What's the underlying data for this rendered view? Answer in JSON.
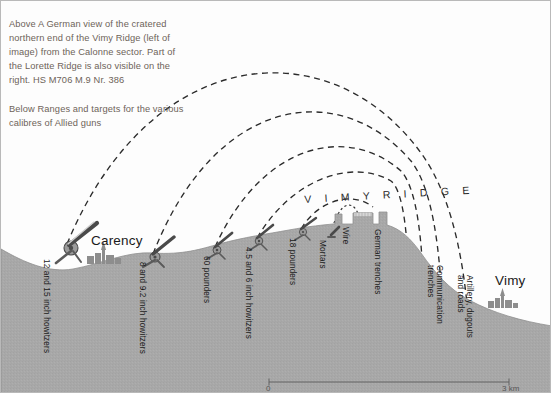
{
  "caption": {
    "above": "Above A German view of the cratered\nnorthern end of the Vimy Ridge (left of\nimage) from the Calonne sector. Part of\nthe Lorette Ridge is also visible on the\nright. HS M706 M.9 Nr. 386",
    "below": "Below Ranges and targets for the various\ncalibres of Allied guns"
  },
  "diagram": {
    "ridge_title": "V I M Y   R I D G E",
    "places": [
      {
        "name": "Carency"
      },
      {
        "name": "Vimy"
      }
    ],
    "gun_labels": [
      {
        "text": "12 and 15 inch howitzers"
      },
      {
        "text": "8 and 9.2 inch howitzers"
      },
      {
        "text": "60 pounders"
      },
      {
        "text": "4.5 and 6 inch howitzers"
      },
      {
        "text": "18 pounders"
      },
      {
        "text": "Mortars"
      }
    ],
    "target_labels": [
      {
        "text": "Wire"
      },
      {
        "text": "German trenches"
      },
      {
        "text": "Communication\ntrenches"
      },
      {
        "text": "Artillery, dugouts\nand roads"
      }
    ],
    "scale": {
      "min": "0",
      "max": "3 km"
    },
    "colors": {
      "terrain": "#a8a8a8",
      "terrain_edge": "#8f8f8f",
      "trajectory": "#2b2b2b",
      "caption_text": "#6d6359",
      "label_text": "#1a1a1a",
      "background": "#fdfdfd"
    }
  }
}
